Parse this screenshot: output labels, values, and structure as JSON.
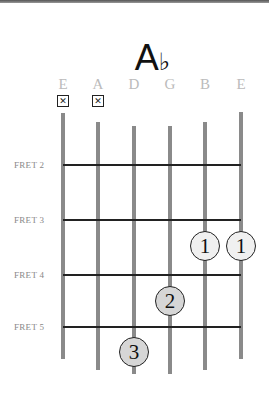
{
  "chord": {
    "root": "A",
    "accidental": "♭"
  },
  "strings": [
    {
      "name": "E",
      "x": 63,
      "top": 113,
      "bottom": 359,
      "muted": true
    },
    {
      "name": "A",
      "x": 98,
      "top": 122,
      "bottom": 370,
      "muted": true
    },
    {
      "name": "D",
      "x": 134,
      "top": 126,
      "bottom": 374,
      "muted": false
    },
    {
      "name": "G",
      "x": 170,
      "top": 126,
      "bottom": 374,
      "muted": false
    },
    {
      "name": "B",
      "x": 205,
      "top": 122,
      "bottom": 370,
      "muted": false
    },
    {
      "name": "E",
      "x": 241,
      "top": 112,
      "bottom": 359,
      "muted": false
    }
  ],
  "mute_symbol": "✕",
  "frets": [
    {
      "label": "FRET 2",
      "y": 165
    },
    {
      "label": "FRET 3",
      "y": 220
    },
    {
      "label": "FRET 4",
      "y": 275
    },
    {
      "label": "FRET 5",
      "y": 327
    }
  ],
  "fingers": [
    {
      "finger": "1",
      "string": "B",
      "between_frets": "3-4",
      "x": 205,
      "y": 246,
      "fill": "#f0f0f0"
    },
    {
      "finger": "1",
      "string": "E",
      "between_frets": "3-4",
      "x": 241,
      "y": 246,
      "fill": "#f0f0f0"
    },
    {
      "finger": "2",
      "string": "G",
      "between_frets": "4-5",
      "x": 170,
      "y": 301,
      "fill": "#d6d6d6"
    },
    {
      "finger": "3",
      "string": "D",
      "between_frets": "5-6",
      "x": 134,
      "y": 352,
      "fill": "#d6d6d6"
    }
  ]
}
